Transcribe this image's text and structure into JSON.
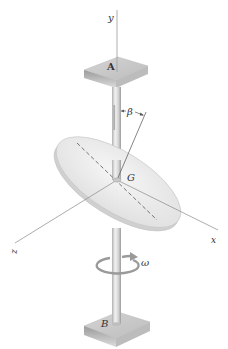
{
  "figure": {
    "type": "engineering-dynamics-diagram"
  },
  "labels": {
    "y_axis": "y",
    "x_axis": "x",
    "z_axis": "z",
    "bearing_top": "A",
    "bearing_bottom": "B",
    "center_of_mass": "G",
    "tilt_angle": "β",
    "angular_velocity": "ω"
  },
  "colors": {
    "background": "#ffffff",
    "axis_line": "#9a9a9a",
    "plate_top": "#c9c9c9",
    "plate_front": "#9e9e9e",
    "plate_side": "#b5b5b5",
    "shaft_light": "#e4e4e4",
    "shaft_dark": "#a8a8a8",
    "disk_face": "#ebebeb",
    "disk_edge": "#d2d2d2",
    "label_text": "#333333"
  }
}
